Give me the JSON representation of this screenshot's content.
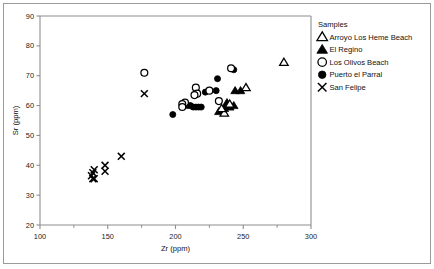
{
  "figure": {
    "background_color": "#ffffff",
    "frame_color": "#9a9a9a",
    "axis_color": "#8e8e8e",
    "marker_color": "#000000"
  },
  "legend": {
    "title": "Samples",
    "position": "right",
    "entries": [
      {
        "label": "Arroyo Los Heme Beach",
        "marker": "open-triangle",
        "marker_name": "open-triangle-icon"
      },
      {
        "label": "El Regino",
        "marker": "filled-triangle",
        "marker_name": "filled-triangle-icon"
      },
      {
        "label": "Los Olivos Beach",
        "marker": "open-circle",
        "marker_name": "open-circle-icon"
      },
      {
        "label": "Puerto el Parral",
        "marker": "filled-circle",
        "marker_name": "filled-circle-icon"
      },
      {
        "label": "San Felipe",
        "marker": "cross",
        "marker_name": "cross-icon"
      }
    ]
  },
  "chart_data": {
    "type": "scatter",
    "title": "",
    "xlabel": "Zr (ppm)",
    "ylabel": "Sr (ppm)",
    "xlim": [
      100,
      300
    ],
    "ylim": [
      20,
      90
    ],
    "xticks": [
      100,
      150,
      200,
      250,
      300
    ],
    "xticks_minor": [
      125,
      175,
      225,
      275
    ],
    "yticks": [
      20,
      30,
      40,
      50,
      60,
      70,
      80,
      90
    ],
    "grid": false,
    "legend_position": "right",
    "series": [
      {
        "name": "Arroyo Los Heme Beach",
        "marker": "open-triangle",
        "points": [
          [
            280,
            74.5
          ],
          [
            252,
            66.0
          ],
          [
            240,
            60.5
          ],
          [
            236,
            57.5
          ],
          [
            234,
            59.0
          ]
        ]
      },
      {
        "name": "El Regino",
        "marker": "filled-triangle",
        "points": [
          [
            248,
            65.0
          ],
          [
            244,
            65.0
          ],
          [
            243,
            60.0
          ],
          [
            240,
            59.5
          ],
          [
            238,
            61.0
          ],
          [
            236,
            59.0
          ],
          [
            234,
            58.5
          ],
          [
            232,
            58.0
          ]
        ]
      },
      {
        "name": "Los Olivos Beach",
        "marker": "open-circle",
        "points": [
          [
            177,
            71.0
          ],
          [
            241,
            72.5
          ],
          [
            225,
            65.0
          ],
          [
            215,
            66.0
          ],
          [
            216,
            64.0
          ],
          [
            214,
            63.5
          ],
          [
            232,
            61.5
          ],
          [
            207,
            61.0
          ],
          [
            205,
            60.5
          ],
          [
            205,
            59.5
          ]
        ]
      },
      {
        "name": "Puerto el Parral",
        "marker": "filled-circle",
        "points": [
          [
            243,
            72.0
          ],
          [
            231,
            69.0
          ],
          [
            230,
            65.0
          ],
          [
            216,
            64.0
          ],
          [
            222,
            64.5
          ],
          [
            198,
            57.0
          ],
          [
            206,
            60.0
          ],
          [
            209,
            60.0
          ],
          [
            211,
            60.0
          ],
          [
            213,
            59.5
          ],
          [
            215,
            59.5
          ],
          [
            217,
            59.5
          ],
          [
            219,
            59.5
          ]
        ]
      },
      {
        "name": "San Felipe",
        "marker": "cross",
        "points": [
          [
            177,
            64.0
          ],
          [
            160,
            43.0
          ],
          [
            148,
            40.0
          ],
          [
            148,
            38.0
          ],
          [
            140,
            38.5
          ],
          [
            139,
            37.5
          ],
          [
            138,
            36.5
          ],
          [
            139,
            35.5
          ],
          [
            140,
            35.5
          ]
        ]
      }
    ]
  }
}
